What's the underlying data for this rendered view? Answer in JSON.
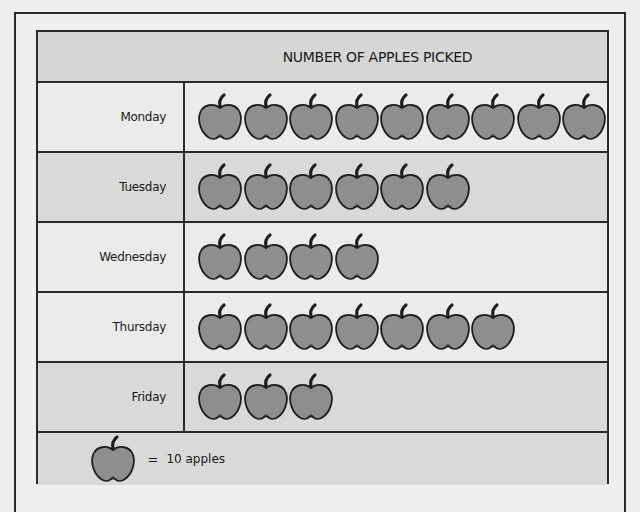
{
  "chart_data": {
    "type": "pictograph",
    "title": "NUMBER OF APPLES PICKED",
    "categories": [
      "Monday",
      "Tuesday",
      "Wednesday",
      "Thursday",
      "Friday"
    ],
    "icon_counts": [
      9,
      6,
      4,
      7,
      3
    ],
    "values": [
      90,
      60,
      40,
      70,
      30
    ],
    "unit_per_icon": 10,
    "icon": "apple-icon",
    "legend": "= 10 apples",
    "xlabel": "",
    "ylabel": ""
  },
  "title": "NUMBER OF APPLES PICKED",
  "rows": [
    {
      "day": "Monday",
      "count": 9,
      "shade": "light"
    },
    {
      "day": "Tuesday",
      "count": 6,
      "shade": "dark"
    },
    {
      "day": "Wednesday",
      "count": 4,
      "shade": "light"
    },
    {
      "day": "Thursday",
      "count": 7,
      "shade": "light"
    },
    {
      "day": "Friday",
      "count": 3,
      "shade": "dark"
    }
  ],
  "key": {
    "equals": "=",
    "text": "10 apples"
  },
  "colors": {
    "apple_fill": "#8e8e8c",
    "outline": "#1e1e1e",
    "title_bg": "#d6d6d4",
    "row_light": "#ebebea",
    "row_dark": "#d9d9d7"
  }
}
